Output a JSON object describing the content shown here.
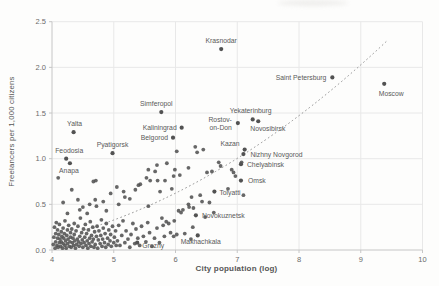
{
  "chart_data": {
    "type": "scatter",
    "title": "",
    "xlabel": "City population (log)",
    "ylabel": "Freelancers per 1,000 citizens",
    "xlim": [
      4,
      10
    ],
    "ylim": [
      0,
      2.5
    ],
    "xticks": [
      "4",
      "5",
      "6",
      "7",
      "8",
      "9",
      "10"
    ],
    "yticks": [
      "0.0",
      "0.5",
      "1.0",
      "1.5",
      "2.0",
      "2.5"
    ],
    "grid": true,
    "legend": "none",
    "colors": {
      "point": "#525252",
      "grid": "#e8e8e8",
      "axis": "#c6c6c6",
      "tick_text": "#6b6b6b",
      "point_label": "#595959",
      "trendline": "#8f8f8f"
    },
    "trendline": {
      "style": "dotted",
      "start": [
        4.53,
        0.22
      ],
      "control": [
        7.0,
        0.74
      ],
      "end": [
        9.44,
        2.3
      ]
    },
    "labeled_points": [
      {
        "name": "Krasnodar",
        "x": 6.74,
        "y": 2.2,
        "anchor": "middle",
        "dx": 0,
        "dy": -6
      },
      {
        "name": "Saint Petersburg",
        "x": 8.54,
        "y": 1.89,
        "anchor": "end",
        "dx": -6,
        "dy": 2.5
      },
      {
        "name": "Moscow",
        "x": 9.38,
        "y": 1.82,
        "anchor": "middle",
        "dx": 7,
        "dy": 12
      },
      {
        "name": "Yekaterinburg",
        "x": 7.25,
        "y": 1.43,
        "anchor": "middle",
        "dx": -2,
        "dy": -6
      },
      {
        "name": "Novosibirsk",
        "x": 7.34,
        "y": 1.41,
        "anchor": "start",
        "dx": -8,
        "dy": 9.5
      },
      {
        "name": "Rostov-on-Don",
        "x": 7.01,
        "y": 1.39,
        "anchor": "end",
        "dx": -6,
        "dy": -1,
        "lines": [
          "Rostov-",
          "on-Don"
        ],
        "line_height": 8
      },
      {
        "name": "Simferopol",
        "x": 5.77,
        "y": 1.51,
        "anchor": "middle",
        "dx": -5,
        "dy": -6
      },
      {
        "name": "Kaliningrad",
        "x": 6.1,
        "y": 1.34,
        "anchor": "end",
        "dx": -5,
        "dy": 2.5
      },
      {
        "name": "Belgorod",
        "x": 5.96,
        "y": 1.23,
        "anchor": "end",
        "dx": -5,
        "dy": 2.5
      },
      {
        "name": "Yalta",
        "x": 4.35,
        "y": 1.29,
        "anchor": "middle",
        "dx": 1,
        "dy": -6
      },
      {
        "name": "Pyatigorsk",
        "x": 4.98,
        "y": 1.06,
        "anchor": "middle",
        "dx": 0,
        "dy": -6
      },
      {
        "name": "Feodosia",
        "x": 4.23,
        "y": 1.0,
        "anchor": "middle",
        "dx": 3,
        "dy": -5.5
      },
      {
        "name": "Anapa",
        "x": 4.29,
        "y": 0.95,
        "anchor": "middle",
        "dx": -1,
        "dy": 10
      },
      {
        "name": "Kazan",
        "x": 7.12,
        "y": 1.1,
        "anchor": "end",
        "dx": -5,
        "dy": -3.5
      },
      {
        "name": "Nizhny Novgorod",
        "x": 7.1,
        "y": 1.05,
        "anchor": "start",
        "dx": 7,
        "dy": 2.5
      },
      {
        "name": "Chelyabinsk",
        "x": 7.06,
        "y": 0.94,
        "anchor": "start",
        "dx": 6,
        "dy": 2.5
      },
      {
        "name": "Omsk",
        "x": 7.06,
        "y": 0.76,
        "anchor": "start",
        "dx": 7,
        "dy": 2.5
      },
      {
        "name": "Tolyatti",
        "x": 6.63,
        "y": 0.64,
        "anchor": "start",
        "dx": 5,
        "dy": 3
      },
      {
        "name": "Novokuznetsk",
        "x": 6.33,
        "y": 0.38,
        "anchor": "start",
        "dx": 6,
        "dy": 2.5
      },
      {
        "name": "Grozny",
        "x": 5.38,
        "y": 0.08,
        "anchor": "start",
        "dx": 5,
        "dy": 5
      },
      {
        "name": "Makhachkala",
        "x": 6.36,
        "y": 0.16,
        "anchor": "middle",
        "dx": 3,
        "dy": 9
      }
    ],
    "points": [
      [
        4.02,
        0.06
      ],
      [
        4.03,
        0.14
      ],
      [
        4.04,
        0.25
      ],
      [
        4.05,
        0.02
      ],
      [
        4.06,
        0.18
      ],
      [
        4.06,
        0.09
      ],
      [
        4.07,
        0.3
      ],
      [
        4.08,
        0.05
      ],
      [
        4.09,
        0.13
      ],
      [
        4.09,
        0.22
      ],
      [
        4.1,
        0.03
      ],
      [
        4.11,
        0.17
      ],
      [
        4.12,
        0.08
      ],
      [
        4.12,
        0.28
      ],
      [
        4.13,
        0.12
      ],
      [
        4.14,
        0.04
      ],
      [
        4.15,
        0.2
      ],
      [
        4.15,
        0.09
      ],
      [
        4.16,
        0.15
      ],
      [
        4.17,
        0.02
      ],
      [
        4.18,
        0.24
      ],
      [
        4.18,
        0.07
      ],
      [
        4.19,
        0.13
      ],
      [
        4.2,
        0.18
      ],
      [
        4.21,
        0.05
      ],
      [
        4.21,
        0.32
      ],
      [
        4.22,
        0.1
      ],
      [
        4.23,
        0.02
      ],
      [
        4.24,
        0.16
      ],
      [
        4.25,
        0.22
      ],
      [
        4.25,
        0.07
      ],
      [
        4.26,
        0.12
      ],
      [
        4.27,
        0.27
      ],
      [
        4.28,
        0.04
      ],
      [
        4.29,
        0.09
      ],
      [
        4.3,
        0.19
      ],
      [
        4.3,
        0.14
      ],
      [
        4.31,
        0.03
      ],
      [
        4.32,
        0.23
      ],
      [
        4.33,
        0.08
      ],
      [
        4.34,
        0.13
      ],
      [
        4.35,
        0.05
      ],
      [
        4.36,
        0.17
      ],
      [
        4.36,
        0.29
      ],
      [
        4.37,
        0.1
      ],
      [
        4.38,
        0.02
      ],
      [
        4.39,
        0.21
      ],
      [
        4.4,
        0.06
      ],
      [
        4.41,
        0.12
      ],
      [
        4.42,
        0.26
      ],
      [
        4.43,
        0.09
      ],
      [
        4.44,
        0.04
      ],
      [
        4.45,
        0.15
      ],
      [
        4.46,
        0.35
      ],
      [
        4.47,
        0.07
      ],
      [
        4.48,
        0.19
      ],
      [
        4.49,
        0.11
      ],
      [
        4.5,
        0.03
      ],
      [
        4.51,
        0.23
      ],
      [
        4.52,
        0.08
      ],
      [
        4.53,
        0.14
      ],
      [
        4.54,
        0.28
      ],
      [
        4.55,
        0.05
      ],
      [
        4.56,
        0.18
      ],
      [
        4.57,
        0.1
      ],
      [
        4.58,
        0.02
      ],
      [
        4.59,
        0.22
      ],
      [
        4.6,
        0.07
      ],
      [
        4.61,
        0.13
      ],
      [
        4.62,
        0.31
      ],
      [
        4.63,
        0.04
      ],
      [
        4.64,
        0.16
      ],
      [
        4.65,
        0.09
      ],
      [
        4.66,
        0.25
      ],
      [
        4.67,
        0.12
      ],
      [
        4.68,
        0.03
      ],
      [
        4.69,
        0.2
      ],
      [
        4.7,
        0.06
      ],
      [
        4.72,
        0.15
      ],
      [
        4.73,
        0.26
      ],
      [
        4.74,
        0.02
      ],
      [
        4.75,
        0.11
      ],
      [
        4.76,
        0.21
      ],
      [
        4.78,
        0.07
      ],
      [
        4.79,
        0.16
      ],
      [
        4.8,
        0.33
      ],
      [
        4.81,
        0.04
      ],
      [
        4.82,
        0.12
      ],
      [
        4.83,
        0.24
      ],
      [
        4.85,
        0.08
      ],
      [
        4.86,
        0.18
      ],
      [
        4.87,
        0.03
      ],
      [
        4.88,
        0.29
      ],
      [
        4.9,
        0.13
      ],
      [
        4.91,
        0.06
      ],
      [
        4.92,
        0.22
      ],
      [
        4.94,
        0.1
      ],
      [
        4.95,
        0.17
      ],
      [
        4.96,
        0.04
      ],
      [
        4.98,
        0.26
      ],
      [
        5.0,
        0.08
      ],
      [
        5.01,
        0.14
      ],
      [
        5.03,
        0.21
      ],
      [
        5.04,
        0.05
      ],
      [
        4.25,
        0.4
      ],
      [
        4.45,
        0.44
      ],
      [
        4.57,
        0.4
      ],
      [
        4.72,
        0.48
      ],
      [
        4.88,
        0.43
      ],
      [
        4.5,
        0.47
      ],
      [
        4.18,
        0.52
      ],
      [
        4.42,
        0.55
      ],
      [
        4.61,
        0.5
      ],
      [
        4.83,
        0.53
      ],
      [
        5.08,
        0.5
      ],
      [
        4.7,
        0.55
      ],
      [
        4.1,
        0.79
      ],
      [
        4.32,
        0.66
      ],
      [
        4.67,
        0.75
      ],
      [
        4.71,
        0.76
      ],
      [
        5.06,
        0.1
      ],
      [
        5.08,
        0.27
      ],
      [
        5.1,
        0.05
      ],
      [
        5.13,
        0.16
      ],
      [
        5.15,
        0.32
      ],
      [
        5.18,
        0.08
      ],
      [
        5.2,
        0.21
      ],
      [
        5.23,
        0.12
      ],
      [
        5.26,
        0.03
      ],
      [
        5.28,
        0.17
      ],
      [
        5.31,
        0.29
      ],
      [
        5.34,
        0.07
      ],
      [
        5.36,
        0.23
      ],
      [
        5.39,
        0.13
      ],
      [
        5.42,
        0.05
      ],
      [
        5.45,
        0.26
      ],
      [
        5.48,
        0.15
      ],
      [
        5.52,
        0.09
      ],
      [
        5.55,
        0.3
      ],
      [
        5.58,
        0.19
      ],
      [
        5.62,
        0.04
      ],
      [
        5.66,
        0.13
      ],
      [
        5.7,
        0.24
      ],
      [
        5.74,
        0.08
      ],
      [
        5.78,
        0.35
      ],
      [
        5.8,
        0.27
      ],
      [
        5.82,
        0.15
      ],
      [
        5.85,
        0.31
      ],
      [
        5.89,
        0.29
      ],
      [
        5.92,
        0.19
      ],
      [
        5.97,
        0.15
      ],
      [
        5.98,
        0.32
      ],
      [
        6.02,
        0.17
      ],
      [
        6.05,
        0.43
      ],
      [
        6.09,
        0.41
      ],
      [
        6.12,
        0.44
      ],
      [
        6.15,
        0.18
      ],
      [
        6.21,
        0.5
      ],
      [
        6.22,
        0.47
      ],
      [
        6.25,
        0.12
      ],
      [
        6.28,
        0.25
      ],
      [
        5.18,
        0.58
      ],
      [
        5.26,
        0.56
      ],
      [
        5.4,
        0.71
      ],
      [
        5.56,
        0.48
      ],
      [
        5.56,
        0.88
      ],
      [
        5.67,
        0.86
      ],
      [
        5.7,
        0.93
      ],
      [
        5.71,
        0.76
      ],
      [
        5.75,
        0.64
      ],
      [
        5.83,
        0.76
      ],
      [
        5.86,
        0.95
      ],
      [
        5.94,
        0.67
      ],
      [
        5.97,
        0.81
      ],
      [
        5.99,
        0.88
      ],
      [
        6.02,
        1.08
      ],
      [
        6.07,
        0.82
      ],
      [
        6.21,
        0.9
      ],
      [
        6.26,
        0.58
      ],
      [
        6.29,
        0.46
      ],
      [
        6.32,
        1.13
      ],
      [
        6.35,
        1.07
      ],
      [
        6.4,
        0.6
      ],
      [
        6.43,
        0.53
      ],
      [
        5.43,
        0.72
      ],
      [
        5.53,
        0.79
      ],
      [
        5.59,
        0.76
      ],
      [
        5.16,
        0.64
      ],
      [
        5.35,
        0.66
      ],
      [
        4.95,
        0.62
      ],
      [
        5.05,
        0.69
      ],
      [
        6.45,
        1.1
      ],
      [
        6.51,
        0.85
      ],
      [
        6.59,
        0.86
      ],
      [
        6.7,
        0.96
      ],
      [
        6.73,
        0.92
      ],
      [
        6.91,
        0.88
      ],
      [
        6.94,
        0.85
      ],
      [
        6.97,
        0.81
      ],
      [
        7.07,
        0.96
      ],
      [
        7.1,
        0.6
      ],
      [
        6.48,
        0.36
      ],
      [
        6.55,
        0.52
      ],
      [
        6.62,
        0.41
      ],
      [
        6.85,
        0.67
      ]
    ]
  }
}
